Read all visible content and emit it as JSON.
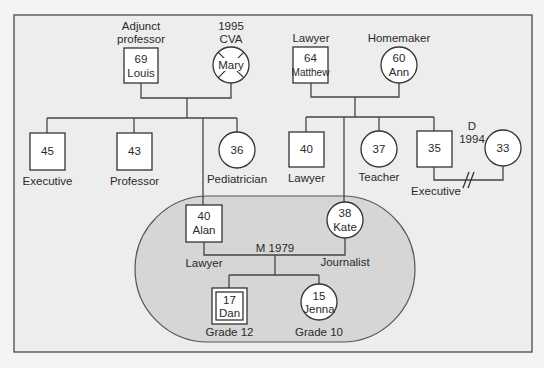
{
  "diagram": {
    "type": "genogram",
    "colors": {
      "frame_bg": "#ededed",
      "household_fill": "#d6d6d6",
      "node_fill": "#ffffff",
      "line": "#444444"
    },
    "grandparents_paternal": {
      "father": {
        "age": "69",
        "name": "Louis",
        "label": "Adjunct professor",
        "label_line1": "Adjunct",
        "label_line2": "professor",
        "gender": "male"
      },
      "mother": {
        "name": "Mary",
        "label_line1": "1995",
        "label_line2": "CVA",
        "deceased": true,
        "gender": "female"
      }
    },
    "grandparents_maternal": {
      "father": {
        "age": "64",
        "name": "Matthew",
        "label": "Lawyer",
        "gender": "male"
      },
      "mother": {
        "age": "60",
        "name": "Ann",
        "label": "Homemaker",
        "gender": "female"
      }
    },
    "paternal_siblings": [
      {
        "age": "45",
        "label": "Executive",
        "gender": "male"
      },
      {
        "age": "43",
        "label": "Professor",
        "gender": "male"
      },
      {
        "age": "36",
        "label": "Pediatrician",
        "gender": "female"
      }
    ],
    "maternal_siblings": [
      {
        "age": "40",
        "label": "Lawyer",
        "gender": "male"
      },
      {
        "age": "37",
        "label": "Teacher",
        "gender": "female"
      },
      {
        "age": "35",
        "label": "Executive",
        "gender": "male"
      }
    ],
    "divorce": {
      "spouse_age": "33",
      "mark_line1": "D",
      "mark_line2": "1994",
      "symbol": "//"
    },
    "couple": {
      "husband": {
        "age": "40",
        "name": "Alan",
        "label": "Lawyer",
        "gender": "male"
      },
      "wife": {
        "age": "38",
        "name": "Kate",
        "label": "Journalist",
        "gender": "female"
      },
      "marriage": "M 1979"
    },
    "children": [
      {
        "age": "17",
        "name": "Dan",
        "label": "Grade 12",
        "gender": "male",
        "identified_patient": true
      },
      {
        "age": "15",
        "name": "Jenna",
        "label": "Grade 10",
        "gender": "female"
      }
    ]
  }
}
